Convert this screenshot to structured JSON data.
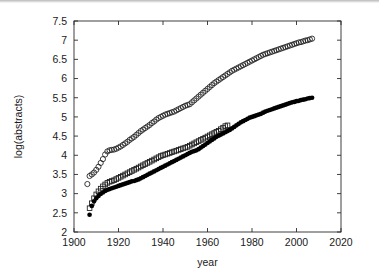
{
  "figure": {
    "background_color": "#ffffff",
    "frame_color": "#2b2b2b",
    "text_color": "#1a1a1a"
  },
  "chart_data": {
    "type": "scatter",
    "title": "",
    "xlabel": "year",
    "ylabel": "log(abstracts)",
    "xlim": [
      1900,
      2020
    ],
    "ylim": [
      2,
      7.5
    ],
    "xticks": [
      1900,
      1920,
      1940,
      1960,
      1980,
      2000,
      2020
    ],
    "xticklabels": [
      "1900",
      "1920",
      "1940",
      "1960",
      "1980",
      "2000",
      "2020"
    ],
    "yticks": [
      2,
      2.5,
      3,
      3.5,
      4,
      4.5,
      5,
      5.5,
      6,
      6.5,
      7,
      7.5
    ],
    "yticklabels": [
      "2",
      "2.5",
      "3",
      "3.5",
      "4",
      "4.5",
      "5",
      "5.5",
      "6",
      "6.5",
      "7",
      "7.5"
    ],
    "grid": false,
    "legend": "none",
    "series": [
      {
        "name": "open-circles",
        "marker": "open-circle",
        "color": "#1c1c1c",
        "points": [
          [
            1906,
            3.25
          ],
          [
            1907,
            3.46
          ],
          [
            1908,
            3.5
          ],
          [
            1909,
            3.55
          ],
          [
            1910,
            3.62
          ],
          [
            1911,
            3.7
          ],
          [
            1912,
            3.8
          ],
          [
            1913,
            3.9
          ],
          [
            1914,
            4.02
          ],
          [
            1915,
            4.1
          ],
          [
            1916,
            4.13
          ],
          [
            1917,
            4.14
          ],
          [
            1918,
            4.15
          ],
          [
            1919,
            4.17
          ],
          [
            1920,
            4.2
          ],
          [
            1921,
            4.23
          ],
          [
            1922,
            4.27
          ],
          [
            1923,
            4.31
          ],
          [
            1924,
            4.35
          ],
          [
            1925,
            4.4
          ],
          [
            1926,
            4.44
          ],
          [
            1927,
            4.48
          ],
          [
            1928,
            4.53
          ],
          [
            1929,
            4.58
          ],
          [
            1930,
            4.63
          ],
          [
            1931,
            4.67
          ],
          [
            1932,
            4.71
          ],
          [
            1933,
            4.75
          ],
          [
            1934,
            4.79
          ],
          [
            1935,
            4.84
          ],
          [
            1936,
            4.88
          ],
          [
            1937,
            4.93
          ],
          [
            1938,
            4.97
          ],
          [
            1939,
            5.0
          ],
          [
            1940,
            5.03
          ],
          [
            1941,
            5.06
          ],
          [
            1942,
            5.08
          ],
          [
            1943,
            5.1
          ],
          [
            1944,
            5.12
          ],
          [
            1945,
            5.14
          ],
          [
            1946,
            5.17
          ],
          [
            1947,
            5.2
          ],
          [
            1948,
            5.23
          ],
          [
            1949,
            5.26
          ],
          [
            1950,
            5.29
          ],
          [
            1951,
            5.31
          ],
          [
            1952,
            5.33
          ],
          [
            1953,
            5.38
          ],
          [
            1954,
            5.43
          ],
          [
            1955,
            5.48
          ],
          [
            1956,
            5.53
          ],
          [
            1957,
            5.58
          ],
          [
            1958,
            5.63
          ],
          [
            1959,
            5.68
          ],
          [
            1960,
            5.73
          ],
          [
            1961,
            5.78
          ],
          [
            1962,
            5.83
          ],
          [
            1963,
            5.88
          ],
          [
            1964,
            5.92
          ],
          [
            1965,
            5.96
          ],
          [
            1966,
            6.0
          ],
          [
            1967,
            6.04
          ],
          [
            1968,
            6.08
          ],
          [
            1969,
            6.12
          ],
          [
            1970,
            6.16
          ],
          [
            1971,
            6.2
          ],
          [
            1972,
            6.23
          ],
          [
            1973,
            6.26
          ],
          [
            1974,
            6.29
          ],
          [
            1975,
            6.32
          ],
          [
            1976,
            6.35
          ],
          [
            1977,
            6.38
          ],
          [
            1978,
            6.41
          ],
          [
            1979,
            6.44
          ],
          [
            1980,
            6.47
          ],
          [
            1981,
            6.5
          ],
          [
            1982,
            6.53
          ],
          [
            1983,
            6.56
          ],
          [
            1984,
            6.59
          ],
          [
            1985,
            6.62
          ],
          [
            1986,
            6.64
          ],
          [
            1987,
            6.66
          ],
          [
            1988,
            6.68
          ],
          [
            1989,
            6.7
          ],
          [
            1990,
            6.72
          ],
          [
            1991,
            6.74
          ],
          [
            1992,
            6.76
          ],
          [
            1993,
            6.78
          ],
          [
            1994,
            6.8
          ],
          [
            1995,
            6.82
          ],
          [
            1996,
            6.84
          ],
          [
            1997,
            6.86
          ],
          [
            1998,
            6.88
          ],
          [
            1999,
            6.9
          ],
          [
            2000,
            6.92
          ],
          [
            2001,
            6.94
          ],
          [
            2002,
            6.95
          ],
          [
            2003,
            6.97
          ],
          [
            2004,
            6.99
          ],
          [
            2005,
            7.0
          ],
          [
            2006,
            7.02
          ],
          [
            2007,
            7.04
          ]
        ]
      },
      {
        "name": "open-squares",
        "marker": "open-square",
        "color": "#1c1c1c",
        "points": [
          [
            1907,
            2.62
          ],
          [
            1908,
            2.75
          ],
          [
            1909,
            2.88
          ],
          [
            1910,
            2.98
          ],
          [
            1911,
            3.06
          ],
          [
            1912,
            3.13
          ],
          [
            1913,
            3.19
          ],
          [
            1914,
            3.24
          ],
          [
            1915,
            3.28
          ],
          [
            1916,
            3.31
          ],
          [
            1917,
            3.33
          ],
          [
            1918,
            3.35
          ],
          [
            1919,
            3.38
          ],
          [
            1920,
            3.41
          ],
          [
            1921,
            3.44
          ],
          [
            1922,
            3.47
          ],
          [
            1923,
            3.5
          ],
          [
            1924,
            3.53
          ],
          [
            1925,
            3.56
          ],
          [
            1926,
            3.59
          ],
          [
            1927,
            3.62
          ],
          [
            1928,
            3.65
          ],
          [
            1929,
            3.68
          ],
          [
            1930,
            3.71
          ],
          [
            1931,
            3.74
          ],
          [
            1932,
            3.77
          ],
          [
            1933,
            3.8
          ],
          [
            1934,
            3.83
          ],
          [
            1935,
            3.86
          ],
          [
            1936,
            3.89
          ],
          [
            1937,
            3.92
          ],
          [
            1938,
            3.95
          ],
          [
            1939,
            3.98
          ],
          [
            1940,
            4.0
          ],
          [
            1941,
            4.02
          ],
          [
            1942,
            4.04
          ],
          [
            1943,
            4.06
          ],
          [
            1944,
            4.08
          ],
          [
            1945,
            4.1
          ],
          [
            1946,
            4.12
          ],
          [
            1947,
            4.14
          ],
          [
            1948,
            4.16
          ],
          [
            1949,
            4.18
          ],
          [
            1950,
            4.2
          ],
          [
            1951,
            4.22
          ],
          [
            1952,
            4.25
          ],
          [
            1953,
            4.28
          ],
          [
            1954,
            4.31
          ],
          [
            1955,
            4.34
          ],
          [
            1956,
            4.37
          ],
          [
            1957,
            4.4
          ],
          [
            1958,
            4.43
          ],
          [
            1959,
            4.46
          ],
          [
            1960,
            4.49
          ],
          [
            1961,
            4.52
          ],
          [
            1962,
            4.55
          ],
          [
            1963,
            4.58
          ],
          [
            1964,
            4.61
          ],
          [
            1965,
            4.64
          ],
          [
            1966,
            4.68
          ],
          [
            1967,
            4.72
          ],
          [
            1968,
            4.76
          ],
          [
            1969,
            4.78
          ]
        ]
      },
      {
        "name": "filled-circles",
        "marker": "filled-circle",
        "color": "#000000",
        "points": [
          [
            1907,
            2.45
          ],
          [
            1908,
            2.68
          ],
          [
            1909,
            2.8
          ],
          [
            1910,
            2.88
          ],
          [
            1911,
            2.94
          ],
          [
            1912,
            2.99
          ],
          [
            1913,
            3.03
          ],
          [
            1914,
            3.07
          ],
          [
            1915,
            3.1
          ],
          [
            1916,
            3.12
          ],
          [
            1917,
            3.14
          ],
          [
            1918,
            3.16
          ],
          [
            1919,
            3.18
          ],
          [
            1920,
            3.2
          ],
          [
            1921,
            3.22
          ],
          [
            1922,
            3.24
          ],
          [
            1923,
            3.26
          ],
          [
            1924,
            3.28
          ],
          [
            1925,
            3.3
          ],
          [
            1926,
            3.32
          ],
          [
            1927,
            3.33
          ],
          [
            1928,
            3.35
          ],
          [
            1929,
            3.37
          ],
          [
            1930,
            3.4
          ],
          [
            1931,
            3.43
          ],
          [
            1932,
            3.46
          ],
          [
            1933,
            3.49
          ],
          [
            1934,
            3.52
          ],
          [
            1935,
            3.55
          ],
          [
            1936,
            3.58
          ],
          [
            1937,
            3.61
          ],
          [
            1938,
            3.64
          ],
          [
            1939,
            3.67
          ],
          [
            1940,
            3.7
          ],
          [
            1941,
            3.73
          ],
          [
            1942,
            3.76
          ],
          [
            1943,
            3.79
          ],
          [
            1944,
            3.82
          ],
          [
            1945,
            3.85
          ],
          [
            1946,
            3.88
          ],
          [
            1947,
            3.91
          ],
          [
            1948,
            3.94
          ],
          [
            1949,
            3.97
          ],
          [
            1950,
            4.0
          ],
          [
            1951,
            4.03
          ],
          [
            1952,
            4.06
          ],
          [
            1953,
            4.09
          ],
          [
            1954,
            4.11
          ],
          [
            1955,
            4.13
          ],
          [
            1956,
            4.16
          ],
          [
            1957,
            4.2
          ],
          [
            1958,
            4.24
          ],
          [
            1959,
            4.28
          ],
          [
            1960,
            4.32
          ],
          [
            1961,
            4.36
          ],
          [
            1962,
            4.4
          ],
          [
            1963,
            4.44
          ],
          [
            1964,
            4.48
          ],
          [
            1965,
            4.51
          ],
          [
            1966,
            4.54
          ],
          [
            1967,
            4.57
          ],
          [
            1968,
            4.6
          ],
          [
            1969,
            4.63
          ],
          [
            1970,
            4.66
          ],
          [
            1971,
            4.7
          ],
          [
            1972,
            4.74
          ],
          [
            1973,
            4.78
          ],
          [
            1974,
            4.82
          ],
          [
            1975,
            4.86
          ],
          [
            1976,
            4.89
          ],
          [
            1977,
            4.92
          ],
          [
            1978,
            4.95
          ],
          [
            1979,
            4.98
          ],
          [
            1980,
            5.0
          ],
          [
            1981,
            5.02
          ],
          [
            1982,
            5.04
          ],
          [
            1983,
            5.06
          ],
          [
            1984,
            5.08
          ],
          [
            1985,
            5.11
          ],
          [
            1986,
            5.14
          ],
          [
            1987,
            5.16
          ],
          [
            1988,
            5.18
          ],
          [
            1989,
            5.2
          ],
          [
            1990,
            5.22
          ],
          [
            1991,
            5.24
          ],
          [
            1992,
            5.26
          ],
          [
            1993,
            5.28
          ],
          [
            1994,
            5.3
          ],
          [
            1995,
            5.32
          ],
          [
            1996,
            5.34
          ],
          [
            1997,
            5.36
          ],
          [
            1998,
            5.38
          ],
          [
            1999,
            5.39
          ],
          [
            2000,
            5.41
          ],
          [
            2001,
            5.42
          ],
          [
            2002,
            5.44
          ],
          [
            2003,
            5.45
          ],
          [
            2004,
            5.46
          ],
          [
            2005,
            5.48
          ],
          [
            2006,
            5.49
          ],
          [
            2007,
            5.5
          ]
        ]
      }
    ]
  }
}
